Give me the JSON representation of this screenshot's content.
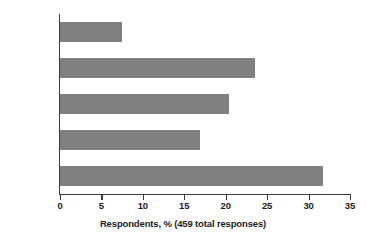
{
  "chart_data": {
    "type": "bar",
    "orientation": "horizontal",
    "title": "",
    "subtitle": "",
    "xlabel": "Respondents, % (459 total responses)",
    "ylabel": "",
    "categories": [
      "1",
      "2",
      "3",
      "4",
      "5 or more"
    ],
    "values": [
      7.5,
      23.5,
      20.4,
      16.9,
      31.8
    ],
    "series": [
      {
        "name": "Respondents",
        "values": [
          7.5,
          23.5,
          20.4,
          16.9,
          31.8
        ]
      }
    ],
    "xlim": [
      0,
      35
    ],
    "xticks": [
      0,
      5,
      10,
      15,
      20,
      25,
      30,
      35
    ],
    "xtick_labels": [
      "0",
      "5",
      "10",
      "15",
      "20",
      "25",
      "30",
      "35"
    ],
    "grid": false,
    "legend": false,
    "legend_position": "none",
    "total_responses": 459,
    "colors": {
      "bar_fill": "#808080",
      "axis": "#3a3a3a",
      "text": "#1c1c1c",
      "background": "#ffffff"
    }
  }
}
